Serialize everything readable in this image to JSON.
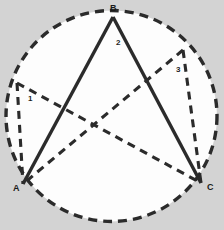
{
  "figure": {
    "kind": "geometry-diagram",
    "background_color": "#d3d3d3",
    "interior_color": "#fdfdfd",
    "stroke_color": "#2b2b2b",
    "width": 224,
    "height": 230,
    "circle": {
      "name": "circumscribed-circle",
      "cx": 111.5,
      "cy": 116,
      "r": 105.5,
      "style": "dashed",
      "dash": "9 6",
      "stroke_width": 3.4
    },
    "points": {
      "A": {
        "x": 23,
        "y": 184
      },
      "B": {
        "x": 113,
        "y": 17
      },
      "C": {
        "x": 201,
        "y": 183
      },
      "D": {
        "x": 17,
        "y": 83
      },
      "E": {
        "x": 183,
        "y": 50
      }
    },
    "solid_edges": [
      {
        "name": "edge-AB",
        "from": "A",
        "to": "B"
      },
      {
        "name": "edge-BC",
        "from": "B",
        "to": "C"
      }
    ],
    "dashed_edges": [
      {
        "name": "edge-DA",
        "from": "D",
        "to": "A"
      },
      {
        "name": "edge-DC",
        "from": "D",
        "to": "C"
      },
      {
        "name": "edge-EC",
        "from": "E",
        "to": "C"
      },
      {
        "name": "edge-EA",
        "from": "E",
        "to": "A"
      }
    ],
    "labels": {
      "vertex_a": {
        "text": "A",
        "x": 13,
        "y": 191,
        "size": 9
      },
      "vertex_b": {
        "text": "B",
        "x": 110,
        "y": 11,
        "size": 9
      },
      "vertex_c": {
        "text": "C",
        "x": 207,
        "y": 190,
        "size": 9
      },
      "angle_1": {
        "text": "1",
        "x": 28,
        "y": 101,
        "size": 8
      },
      "angle_2": {
        "text": "2",
        "x": 116,
        "y": 45,
        "size": 8
      },
      "angle_3": {
        "text": "3",
        "x": 176,
        "y": 72,
        "size": 8
      }
    }
  }
}
